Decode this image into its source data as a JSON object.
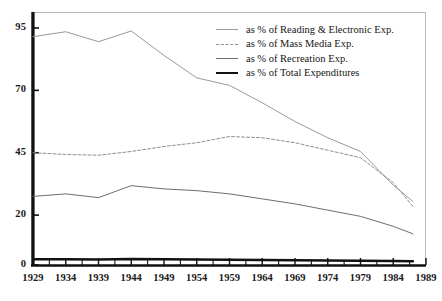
{
  "chart_data": {
    "type": "line",
    "title": "",
    "subtitle": "",
    "xlabel": "",
    "ylabel": "",
    "xlim": [
      1929,
      1989
    ],
    "ylim": [
      0,
      101
    ],
    "grid": false,
    "legend_position": "top-right",
    "y_ticks": [
      0,
      20,
      45,
      70,
      95
    ],
    "y_tick_labels": [
      "0",
      "20",
      "45",
      "70",
      "95"
    ],
    "x_ticks": [
      1929,
      1934,
      1939,
      1944,
      1949,
      1954,
      1959,
      1964,
      1969,
      1974,
      1979,
      1984,
      1989
    ],
    "x_tick_labels": [
      "1929",
      "1934",
      "1939",
      "1944",
      "1949",
      "1954",
      "1959",
      "1964",
      "1969",
      "1974",
      "1979",
      "1984",
      "1989"
    ],
    "x_minor_tick_interval": 2.5,
    "x": [
      1929,
      1934,
      1939,
      1944,
      1949,
      1954,
      1959,
      1964,
      1969,
      1974,
      1979,
      1984,
      1987
    ],
    "series": [
      {
        "name": "as % of Reading & Electronic Exp.",
        "style": "solid-thin",
        "color": "#9a9a9a",
        "values": [
          91.5,
          93.5,
          89.5,
          93.8,
          84.0,
          75.0,
          72.0,
          65.0,
          57.5,
          51.0,
          45.5,
          32.0,
          25.5
        ]
      },
      {
        "name": "as % of Mass Media Exp.",
        "style": "dashed",
        "color": "#8f8f8f",
        "values": [
          45.0,
          44.3,
          44.0,
          45.5,
          47.5,
          49.0,
          51.5,
          51.0,
          49.0,
          46.0,
          43.0,
          33.0,
          23.5
        ]
      },
      {
        "name": "as % of Recreation Exp.",
        "style": "solid-mid",
        "color": "#6e6e6e",
        "values": [
          27.5,
          28.5,
          27.0,
          31.8,
          30.5,
          29.8,
          28.5,
          26.5,
          24.5,
          22.0,
          19.5,
          15.5,
          12.5
        ]
      },
      {
        "name": "as % of Total Expenditures",
        "style": "solid-thick",
        "color": "#111111",
        "values": [
          2.3,
          2.3,
          2.2,
          2.4,
          2.3,
          2.2,
          2.1,
          2.0,
          1.9,
          1.8,
          1.7,
          1.6,
          1.5
        ]
      }
    ]
  },
  "legend": {
    "items": [
      {
        "label": "as % of Reading & Electronic Exp."
      },
      {
        "label": "as % of Mass Media Exp."
      },
      {
        "label": "as % of Recreation Exp."
      },
      {
        "label": "as % of Total Expenditures"
      }
    ]
  }
}
